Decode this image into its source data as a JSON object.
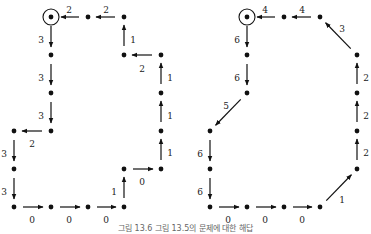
{
  "caption": "그림 13.6   그림 13.5의 문제에 대한 해답",
  "colors": {
    "ink": "#111111",
    "label": "#222222",
    "caption": "#666666"
  },
  "diagrams": [
    {
      "name": "left-grid-path",
      "target": [
        51,
        17
      ],
      "nodes": [
        [
          51,
          17
        ],
        [
          88,
          17
        ],
        [
          124,
          17
        ],
        [
          124,
          55
        ],
        [
          161,
          55
        ],
        [
          161,
          93
        ],
        [
          161,
          131
        ],
        [
          161,
          169
        ],
        [
          124,
          169
        ],
        [
          124,
          207
        ],
        [
          88,
          207
        ],
        [
          51,
          207
        ],
        [
          14,
          207
        ],
        [
          14,
          169
        ],
        [
          14,
          131
        ],
        [
          51,
          131
        ],
        [
          51,
          93
        ],
        [
          51,
          55
        ]
      ],
      "edges": [
        {
          "from": [
            88,
            17
          ],
          "to": [
            51,
            17
          ],
          "label": "2",
          "lx": 69,
          "ly": 10
        },
        {
          "from": [
            124,
            17
          ],
          "to": [
            88,
            17
          ],
          "label": "2",
          "lx": 106,
          "ly": 10
        },
        {
          "from": [
            124,
            55
          ],
          "to": [
            124,
            17
          ],
          "label": "1",
          "lx": 133,
          "ly": 40
        },
        {
          "from": [
            161,
            55
          ],
          "to": [
            124,
            55
          ],
          "label": "2",
          "lx": 142,
          "ly": 69
        },
        {
          "from": [
            161,
            93
          ],
          "to": [
            161,
            55
          ],
          "label": "1",
          "lx": 170,
          "ly": 78
        },
        {
          "from": [
            161,
            131
          ],
          "to": [
            161,
            93
          ],
          "label": "1",
          "lx": 170,
          "ly": 116
        },
        {
          "from": [
            161,
            169
          ],
          "to": [
            161,
            131
          ],
          "label": "1",
          "lx": 170,
          "ly": 153
        },
        {
          "from": [
            124,
            169
          ],
          "to": [
            161,
            169
          ],
          "label": "0",
          "lx": 142,
          "ly": 182
        },
        {
          "from": [
            124,
            207
          ],
          "to": [
            124,
            169
          ],
          "label": "1",
          "lx": 114,
          "ly": 192
        },
        {
          "from": [
            88,
            207
          ],
          "to": [
            124,
            207
          ],
          "label": "0",
          "lx": 106,
          "ly": 220
        },
        {
          "from": [
            51,
            207
          ],
          "to": [
            88,
            207
          ],
          "label": "0",
          "lx": 69,
          "ly": 220
        },
        {
          "from": [
            14,
            207
          ],
          "to": [
            51,
            207
          ],
          "label": "0",
          "lx": 32,
          "ly": 220
        },
        {
          "from": [
            14,
            169
          ],
          "to": [
            14,
            207
          ],
          "label": "3",
          "lx": 4,
          "ly": 192
        },
        {
          "from": [
            14,
            131
          ],
          "to": [
            14,
            169
          ],
          "label": "3",
          "lx": 4,
          "ly": 154
        },
        {
          "from": [
            51,
            131
          ],
          "to": [
            14,
            131
          ],
          "label": "2",
          "lx": 32,
          "ly": 144
        },
        {
          "from": [
            51,
            93
          ],
          "to": [
            51,
            131
          ],
          "label": "3",
          "lx": 41,
          "ly": 116
        },
        {
          "from": [
            51,
            55
          ],
          "to": [
            51,
            93
          ],
          "label": "3",
          "lx": 41,
          "ly": 78
        },
        {
          "from": [
            51,
            17
          ],
          "to": [
            51,
            55
          ],
          "label": "3",
          "lx": 41,
          "ly": 40
        }
      ]
    },
    {
      "name": "right-diagonal-path",
      "target": [
        247,
        17
      ],
      "nodes": [
        [
          247,
          17
        ],
        [
          284,
          17
        ],
        [
          320,
          17
        ],
        [
          357,
          55
        ],
        [
          357,
          93
        ],
        [
          357,
          131
        ],
        [
          357,
          169
        ],
        [
          320,
          207
        ],
        [
          284,
          207
        ],
        [
          247,
          207
        ],
        [
          210,
          207
        ],
        [
          210,
          169
        ],
        [
          210,
          131
        ],
        [
          247,
          93
        ],
        [
          247,
          55
        ]
      ],
      "edges": [
        {
          "from": [
            284,
            17
          ],
          "to": [
            247,
            17
          ],
          "label": "4",
          "lx": 265,
          "ly": 10
        },
        {
          "from": [
            320,
            17
          ],
          "to": [
            284,
            17
          ],
          "label": "4",
          "lx": 302,
          "ly": 10
        },
        {
          "from": [
            357,
            55
          ],
          "to": [
            320,
            17
          ],
          "label": "3",
          "lx": 342,
          "ly": 29
        },
        {
          "from": [
            357,
            93
          ],
          "to": [
            357,
            55
          ],
          "label": "2",
          "lx": 366,
          "ly": 78
        },
        {
          "from": [
            357,
            131
          ],
          "to": [
            357,
            93
          ],
          "label": "2",
          "lx": 366,
          "ly": 116
        },
        {
          "from": [
            357,
            169
          ],
          "to": [
            357,
            131
          ],
          "label": "2",
          "lx": 366,
          "ly": 153
        },
        {
          "from": [
            320,
            207
          ],
          "to": [
            357,
            169
          ],
          "label": "1",
          "lx": 342,
          "ly": 200
        },
        {
          "from": [
            284,
            207
          ],
          "to": [
            320,
            207
          ],
          "label": "0",
          "lx": 302,
          "ly": 220
        },
        {
          "from": [
            247,
            207
          ],
          "to": [
            284,
            207
          ],
          "label": "0",
          "lx": 265,
          "ly": 220
        },
        {
          "from": [
            210,
            207
          ],
          "to": [
            247,
            207
          ],
          "label": "0",
          "lx": 228,
          "ly": 220
        },
        {
          "from": [
            210,
            169
          ],
          "to": [
            210,
            207
          ],
          "label": "6",
          "lx": 200,
          "ly": 192
        },
        {
          "from": [
            210,
            131
          ],
          "to": [
            210,
            169
          ],
          "label": "6",
          "lx": 200,
          "ly": 154
        },
        {
          "from": [
            247,
            93
          ],
          "to": [
            210,
            131
          ],
          "label": "5",
          "lx": 226,
          "ly": 106
        },
        {
          "from": [
            247,
            55
          ],
          "to": [
            247,
            93
          ],
          "label": "6",
          "lx": 237,
          "ly": 78
        },
        {
          "from": [
            247,
            17
          ],
          "to": [
            247,
            55
          ],
          "label": "6",
          "lx": 237,
          "ly": 40
        }
      ]
    }
  ]
}
